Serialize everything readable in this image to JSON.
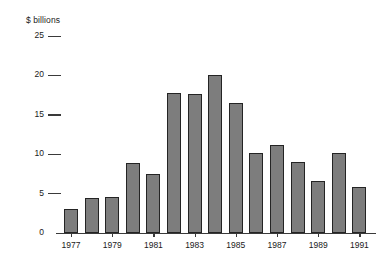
{
  "chart_data": {
    "type": "bar",
    "title": "$ billions",
    "xlabel": "",
    "ylabel": "$ billions",
    "categories": [
      "1977",
      "1978",
      "1979",
      "1980",
      "1981",
      "1982",
      "1983",
      "1984",
      "1985",
      "1986",
      "1987",
      "1988",
      "1989",
      "1990",
      "1991"
    ],
    "values": [
      3.1,
      4.4,
      4.6,
      8.9,
      7.5,
      17.8,
      17.7,
      20.0,
      16.5,
      10.1,
      11.2,
      9.0,
      6.6,
      10.1,
      5.8
    ],
    "ylim": [
      0,
      25
    ],
    "yticks": [
      0,
      5,
      10,
      15,
      20,
      25
    ],
    "ytick_labels": [
      "0",
      "5",
      "10",
      "15",
      "20",
      "25"
    ],
    "xtick_labels": [
      "1977",
      "1979",
      "1981",
      "1983",
      "1985",
      "1987",
      "1989",
      "1991"
    ],
    "xtick_categories": [
      "1977",
      "1979",
      "1981",
      "1983",
      "1985",
      "1987",
      "1989",
      "1991"
    ],
    "grid": false,
    "legend": null,
    "bar_color": "#7d7d7d",
    "bar_edge_color": "#242424",
    "axis_color": "#3a3a3a",
    "background": "#ffffff"
  }
}
